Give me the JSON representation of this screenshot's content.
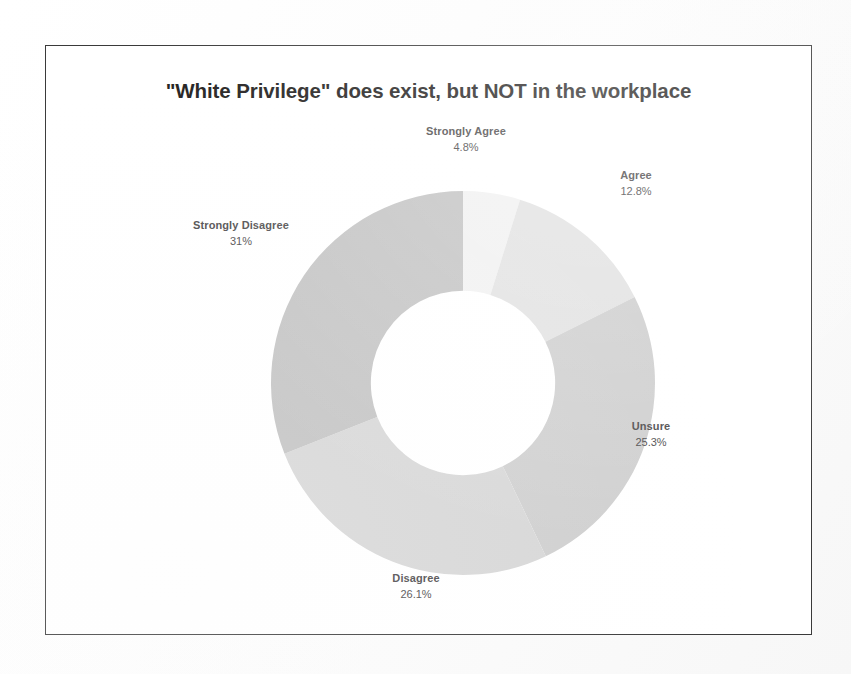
{
  "chart_data": {
    "type": "pie",
    "variant": "donut",
    "title": "\"White Privilege\" does exist, but NOT in the workplace",
    "xlabel": "",
    "ylabel": "",
    "legend_position": "none",
    "labels_position": "outside",
    "grid": false,
    "start_angle_deg": 0,
    "direction": "clockwise",
    "inner_radius_ratio": 0.48,
    "categories": [
      "Strongly Agree",
      "Agree",
      "Unsure",
      "Disagree",
      "Strongly Disagree"
    ],
    "values": [
      4.8,
      12.8,
      25.3,
      26.1,
      31.0
    ],
    "value_labels": [
      "4.8%",
      "12.8%",
      "25.3%",
      "26.1%",
      "31%"
    ],
    "colors": [
      "#f1f1f1",
      "#e2e2e2",
      "#cfcfcf",
      "#d7d7d7",
      "#c3c3c3"
    ],
    "slices": [
      {
        "name": "Strongly Agree",
        "value": 4.8,
        "pct_label": "4.8%",
        "color": "#f1f1f1"
      },
      {
        "name": "Agree",
        "value": 12.8,
        "pct_label": "12.8%",
        "color": "#e2e2e2"
      },
      {
        "name": "Unsure",
        "value": 25.3,
        "pct_label": "25.3%",
        "color": "#cfcfcf"
      },
      {
        "name": "Disagree",
        "value": 26.1,
        "pct_label": "26.1%",
        "color": "#d7d7d7"
      },
      {
        "name": "Strongly Disagree",
        "value": 31.0,
        "pct_label": "31%",
        "color": "#c3c3c3"
      }
    ]
  },
  "frame": {
    "border_color": "#3a3a3a",
    "background": "#ffffff"
  },
  "page": {
    "background": "#fbfbfb"
  }
}
